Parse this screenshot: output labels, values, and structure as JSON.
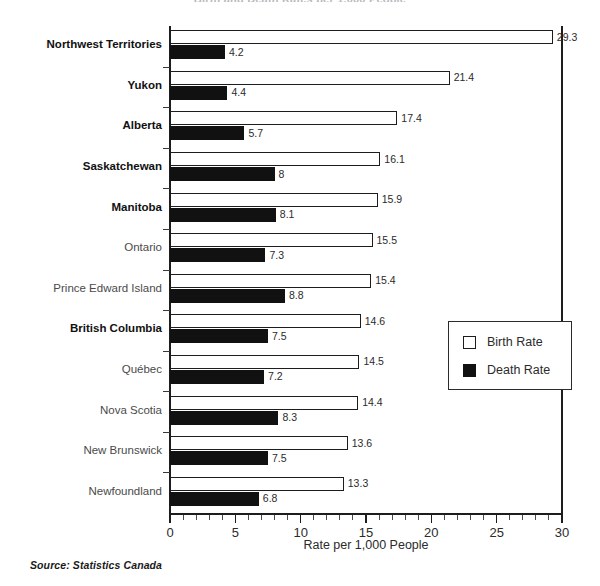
{
  "chart_data": {
    "type": "bar",
    "orientation": "horizontal",
    "title": "Birth and Death Rates per 1,000 People",
    "xlabel": "Rate per 1,000 People",
    "ylabel": "",
    "xlim": [
      0,
      30
    ],
    "xticks": [
      0,
      5,
      10,
      15,
      20,
      25,
      30
    ],
    "xtick_labels": [
      "0",
      "5",
      "10",
      "15",
      "20",
      "25",
      "30"
    ],
    "minor_tick_step": 1,
    "grid": false,
    "legend_position": "right-middle",
    "categories": [
      "Northwest Territories",
      "Yukon",
      "Alberta",
      "Saskatchewan",
      "Manitoba",
      "Ontario",
      "Prince Edward Island",
      "British Columbia",
      "Québec",
      "Nova Scotia",
      "New Brunswick",
      "Newfoundland"
    ],
    "category_emphasis": [
      true,
      true,
      true,
      true,
      true,
      false,
      false,
      true,
      false,
      false,
      false,
      false
    ],
    "series": [
      {
        "name": "Birth Rate",
        "color": "#ffffff",
        "edge_color": "#1d1d1d",
        "values": [
          29.3,
          21.4,
          17.4,
          16.1,
          15.9,
          15.5,
          15.4,
          14.6,
          14.5,
          14.4,
          13.6,
          13.3
        ],
        "value_labels": [
          "29.3",
          "21.4",
          "17.4",
          "16.1",
          "15.9",
          "15.5",
          "15.4",
          "14.6",
          "14.5",
          "14.4",
          "13.6",
          "13.3"
        ]
      },
      {
        "name": "Death Rate",
        "color": "#111111",
        "edge_color": "#111111",
        "values": [
          4.2,
          4.4,
          5.7,
          8,
          8.1,
          7.3,
          8.8,
          7.5,
          7.2,
          8.3,
          7.5,
          6.8
        ],
        "value_labels": [
          "4.2",
          "4.4",
          "5.7",
          "8",
          "8.1",
          "7.3",
          "8.8",
          "7.5",
          "7.2",
          "8.3",
          "7.5",
          "6.8"
        ]
      }
    ]
  },
  "legend": {
    "items": [
      {
        "label": "Birth Rate",
        "swatch": "birth"
      },
      {
        "label": "Death Rate",
        "swatch": "death"
      }
    ]
  },
  "footer": {
    "source": "Source: Statistics Canada"
  }
}
